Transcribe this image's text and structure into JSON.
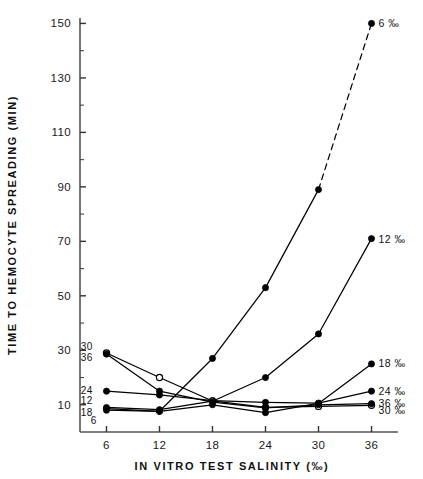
{
  "chart_data": {
    "type": "line",
    "title": "",
    "xlabel": "IN VITRO TEST SALINITY (‰)",
    "ylabel": "TIME TO HEMOCYTE SPREADING (MIN)",
    "x": [
      6,
      12,
      18,
      24,
      30,
      36
    ],
    "xtick_labels": [
      "6",
      "12",
      "18",
      "24",
      "30",
      "36"
    ],
    "ytick_labels": [
      "10",
      "30",
      "50",
      "70",
      "90",
      "110",
      "130",
      "150"
    ],
    "ytick_values": [
      10,
      30,
      50,
      70,
      90,
      110,
      130,
      150
    ],
    "yminor_values": [
      20,
      40,
      60,
      80,
      100,
      120,
      140
    ],
    "xlim": [
      3,
      39
    ],
    "ylim": [
      0,
      152
    ],
    "grid": false,
    "legend_position": "inline-end-of-line",
    "marker": "filled-circle",
    "series": [
      {
        "name": "6 ‰",
        "left_label": "6",
        "right_label": "6 ‰",
        "values": [
          8.0,
          7.6,
          27.0,
          53.0,
          89.0,
          150.0
        ],
        "dashed_from_index": 4,
        "marker_style": "filled"
      },
      {
        "name": "12 ‰",
        "left_label": "12",
        "right_label": "12 ‰",
        "values": [
          9.0,
          8.2,
          11.3,
          20.0,
          36.0,
          71.0
        ],
        "dashed_from_index": null,
        "marker_style": "filled"
      },
      {
        "name": "18 ‰",
        "left_label": "18",
        "right_label": "18 ‰",
        "values": [
          8.6,
          7.6,
          10.0,
          7.1,
          10.5,
          25.0
        ],
        "dashed_from_index": null,
        "marker_style": "filled"
      },
      {
        "name": "24 ‰",
        "left_label": "24",
        "right_label": "24 ‰",
        "values": [
          15.0,
          13.6,
          11.5,
          10.9,
          10.6,
          15.0
        ],
        "dashed_from_index": null,
        "marker_style": "filled"
      },
      {
        "name": "30 ‰",
        "left_label": "30",
        "right_label": "30 ‰",
        "values": [
          29.0,
          20.0,
          11.4,
          9.0,
          9.4,
          9.8
        ],
        "dashed_from_index": null,
        "marker_style": "open"
      },
      {
        "name": "36 ‰",
        "left_label": "36",
        "right_label": "36 ‰",
        "values": [
          28.6,
          15.0,
          11.0,
          8.9,
          10.0,
          10.4
        ],
        "dashed_from_index": null,
        "marker_style": "filled"
      }
    ]
  },
  "colors": {
    "line": "#000000",
    "axis": "#555555",
    "text": "#111111",
    "background": "#ffffff"
  }
}
